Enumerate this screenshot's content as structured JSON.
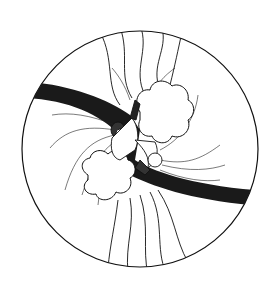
{
  "illustration": {
    "description": "Line drawing inside a circle: two figures embracing among two clouds, crossed by a dark diagonal band, with wavy arrowed lines flowing from top to bottom",
    "colors": {
      "background": "#ffffff",
      "ink": "#111111",
      "band": "#1a1a1a"
    },
    "elements": [
      "circle-frame",
      "dark-band",
      "upper-right-cloud",
      "lower-left-cloud",
      "two-figures",
      "radiating-lines",
      "wavy-arrows-top",
      "wavy-arrows-bottom"
    ]
  }
}
